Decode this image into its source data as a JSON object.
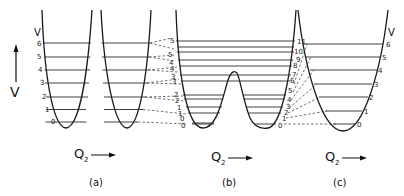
{
  "figure": {
    "energy_axis_label": "V",
    "quantum_number_label": "V",
    "coordinate_label": "Q",
    "coordinate_subscript": "2",
    "panels": [
      {
        "id": "a",
        "label": "(a)",
        "description": "two separate harmonic wells",
        "levels": [
          "0",
          "1",
          "2",
          "3",
          "4",
          "5",
          "6"
        ]
      },
      {
        "id": "b",
        "label": "(b)",
        "description": "double-well potential with central barrier",
        "left_levels": [
          "0",
          "0",
          "1",
          "1",
          "2",
          "2",
          "3",
          "3",
          "4",
          "4",
          "5",
          "5"
        ],
        "right_levels": [
          "0",
          "1",
          "2",
          "3",
          "4",
          "5",
          "6",
          "7",
          "8",
          "9",
          "10",
          "11"
        ]
      },
      {
        "id": "c",
        "label": "(c)",
        "description": "single harmonic well",
        "levels": [
          "0",
          "1",
          "2",
          "3",
          "4",
          "5",
          "6"
        ]
      }
    ]
  }
}
